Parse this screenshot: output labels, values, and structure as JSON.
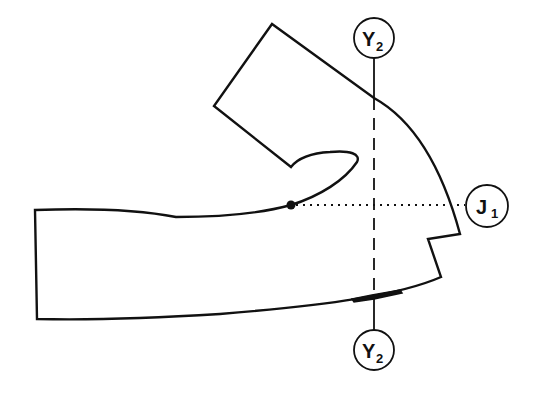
{
  "diagram": {
    "colors": {
      "line": "#111111",
      "background": "#ffffff"
    },
    "labels": {
      "y_top": {
        "main": "Y",
        "sub": "2"
      },
      "y_bottom": {
        "main": "Y",
        "sub": "2"
      },
      "joint": {
        "main": "J",
        "sub": "1"
      }
    },
    "elements": [
      "forearm-hand-outline",
      "vertical-dashed-axis-Y2",
      "horizontal-dotted-axis-J1",
      "pivot-dot",
      "thick-marker-bar"
    ]
  }
}
